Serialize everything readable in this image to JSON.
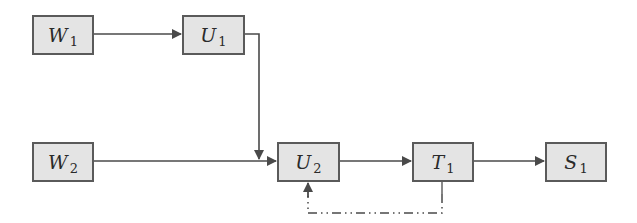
{
  "diagram": {
    "type": "block-flow",
    "nodes": [
      {
        "id": "W1",
        "base": "W",
        "sub": "1",
        "x": 32,
        "y": 15,
        "w": 62,
        "h": 40
      },
      {
        "id": "U1",
        "base": "U",
        "sub": "1",
        "x": 182,
        "y": 15,
        "w": 63,
        "h": 40
      },
      {
        "id": "W2",
        "base": "W",
        "sub": "2",
        "x": 32,
        "y": 142,
        "w": 62,
        "h": 40
      },
      {
        "id": "U2",
        "base": "U",
        "sub": "2",
        "x": 277,
        "y": 143,
        "w": 63,
        "h": 39
      },
      {
        "id": "T1",
        "base": "T",
        "sub": "1",
        "x": 412,
        "y": 142,
        "w": 62,
        "h": 40
      },
      {
        "id": "S1",
        "base": "S",
        "sub": "1",
        "x": 545,
        "y": 142,
        "w": 62,
        "h": 40
      }
    ],
    "edges": [
      {
        "from": "W1",
        "to": "U1",
        "style": "solid"
      },
      {
        "from": "U1",
        "to": "U2",
        "style": "solid",
        "route": "right-down-into-W2-U2-line"
      },
      {
        "from": "W2",
        "to": "U2",
        "style": "solid"
      },
      {
        "from": "U2",
        "to": "T1",
        "style": "solid"
      },
      {
        "from": "T1",
        "to": "S1",
        "style": "solid"
      },
      {
        "from": "T1",
        "to": "U2",
        "style": "dash-dot",
        "route": "feedback-below"
      }
    ],
    "colors": {
      "node_fill": "#e4e4e4",
      "node_border": "#5a5a5a",
      "line": "#4a4a4a",
      "text": "#2a2a2a"
    }
  }
}
